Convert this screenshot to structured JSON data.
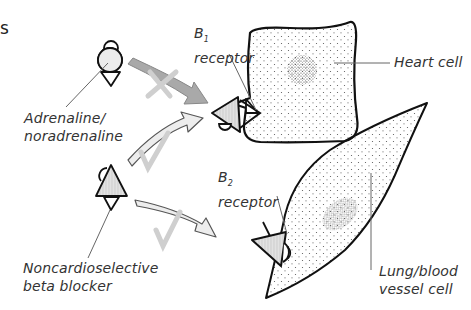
{
  "fragment_text": "s",
  "labels": {
    "agonist": [
      "Adrenaline/",
      "noradrenaline"
    ],
    "blocker": [
      "Noncardioselective",
      "beta blocker"
    ],
    "b1_receptor": {
      "letter": "B",
      "sub": "1",
      "word": "receptor"
    },
    "b2_receptor": {
      "letter": "B",
      "sub": "2",
      "word": "receptor"
    },
    "heart_cell": "Heart cell",
    "lung_cell": [
      "Lung/blood",
      "vessel cell"
    ]
  },
  "arrows": [
    {
      "from": "adrenaline",
      "to": "B1 receptor",
      "status": "blocked",
      "mark": "cross"
    },
    {
      "from": "beta blocker",
      "to": "B1 receptor",
      "status": "binds",
      "mark": "tick"
    },
    {
      "from": "beta blocker",
      "to": "B2 receptor",
      "status": "binds",
      "mark": "tick"
    }
  ],
  "colors": {
    "outline": "#111111",
    "arrow_dark": "#a9a9a9",
    "arrow_light": "#ececec",
    "mark": "#cccccc",
    "text": "#333333",
    "leader": "#666666"
  }
}
